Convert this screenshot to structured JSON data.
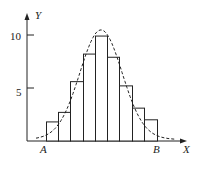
{
  "chart_data": {
    "type": "bar",
    "title": "",
    "xlabel": "X",
    "ylabel": "Y",
    "yticks": [
      "5",
      "10"
    ],
    "ylim": [
      0,
      11
    ],
    "grid": false,
    "annotations": {
      "left_bound": "A",
      "right_bound": "B"
    },
    "bin_edges_px": [
      46,
      58,
      70,
      83,
      95,
      107,
      119,
      132,
      144,
      157
    ],
    "values": [
      1.8,
      2.7,
      5.6,
      8.2,
      9.9,
      7.9,
      5.2,
      3.1,
      2.0
    ],
    "curve": {
      "style": "dashed",
      "description": "bell-shaped density curve overlaid on histogram",
      "peak": 10.1
    },
    "bar_color": "#ffffff",
    "line_color": "#222222"
  }
}
